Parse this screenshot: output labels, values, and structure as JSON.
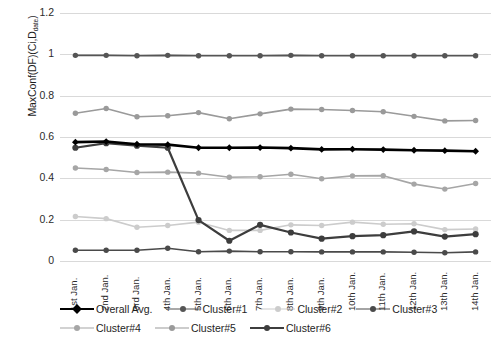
{
  "chart_data": {
    "type": "line",
    "title": "",
    "xlabel": "",
    "ylabel": "MaxConf(DF)(Ci,Ddate)",
    "ylabel_main": "MaxConf(DF)(Ci,D",
    "ylabel_sub": "date",
    "ylabel_tail": ")",
    "ylim": [
      0,
      1.2
    ],
    "yticks": [
      0,
      0.2,
      0.4,
      0.6,
      0.8,
      1,
      1.2
    ],
    "ytick_labels": [
      "0",
      "0.2",
      "0.4",
      "0.6",
      "0.8",
      "1",
      "1.2"
    ],
    "grid": true,
    "legend_position": "bottom",
    "categories": [
      "1st Jan.",
      "2nd Jan.",
      "3rd Jan.",
      "4th Jan.",
      "5th Jan.",
      "6th Jan.",
      "7th Jan.",
      "8th Jan.",
      "9th Jan.",
      "10th Jan.",
      "11th Jan.",
      "12th Jan.",
      "13th Jan.",
      "14th Jan."
    ],
    "series": [
      {
        "name": "Overall Avg.",
        "color": "#000000",
        "marker": "diamond",
        "width": 2.6,
        "values": [
          0.575,
          0.578,
          0.565,
          0.563,
          0.548,
          0.548,
          0.549,
          0.546,
          0.54,
          0.541,
          0.539,
          0.536,
          0.534,
          0.531
        ]
      },
      {
        "name": "Cluster#1",
        "color": "#555555",
        "marker": "circle",
        "width": 1.6,
        "values": [
          0.995,
          0.995,
          0.993,
          0.995,
          0.993,
          0.993,
          0.993,
          0.995,
          0.993,
          0.993,
          0.993,
          0.993,
          0.993,
          0.993
        ]
      },
      {
        "name": "Cluster#2",
        "color": "#cccccc",
        "marker": "circle",
        "width": 1.6,
        "values": [
          0.215,
          0.205,
          0.163,
          0.172,
          0.188,
          0.148,
          0.148,
          0.175,
          0.172,
          0.188,
          0.178,
          0.18,
          0.152,
          0.155
        ]
      },
      {
        "name": "Cluster#3",
        "color": "#4a4a4a",
        "marker": "circle",
        "width": 1.6,
        "values": [
          0.052,
          0.052,
          0.052,
          0.062,
          0.045,
          0.048,
          0.045,
          0.045,
          0.044,
          0.044,
          0.044,
          0.042,
          0.04,
          0.044
        ]
      },
      {
        "name": "Cluster#4",
        "color": "#a6a6a6",
        "marker": "circle",
        "width": 1.6,
        "values": [
          0.45,
          0.443,
          0.428,
          0.43,
          0.425,
          0.405,
          0.408,
          0.42,
          0.398,
          0.412,
          0.413,
          0.372,
          0.348,
          0.375
        ]
      },
      {
        "name": "Cluster#5",
        "color": "#9a9a9a",
        "marker": "circle",
        "width": 1.6,
        "values": [
          0.715,
          0.738,
          0.698,
          0.703,
          0.718,
          0.688,
          0.712,
          0.735,
          0.733,
          0.728,
          0.722,
          0.7,
          0.678,
          0.68
        ]
      },
      {
        "name": "Cluster#6",
        "color": "#3d3d3d",
        "marker": "circle",
        "width": 2.2,
        "values": [
          0.548,
          0.57,
          0.558,
          0.548,
          0.198,
          0.098,
          0.175,
          0.138,
          0.108,
          0.12,
          0.125,
          0.143,
          0.118,
          0.13
        ]
      }
    ]
  },
  "legend": {
    "row1": [
      "Overall Avg.",
      "Cluster#1",
      "Cluster#2",
      "Cluster#3"
    ],
    "row2": [
      "Cluster#4",
      "Cluster#5",
      "Cluster#6"
    ]
  },
  "caption": ""
}
